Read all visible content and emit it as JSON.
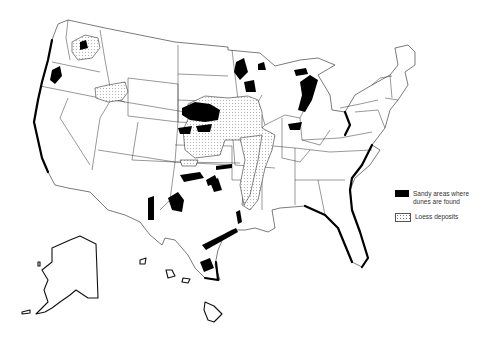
{
  "map": {
    "title": "Sandy areas and loess deposits of the United States",
    "regions_shown": [
      "Contiguous United States",
      "Alaska",
      "Hawaii"
    ]
  },
  "legend": {
    "items": [
      {
        "id": "sandy",
        "label": "Sandy areas where dunes are found",
        "symbol": "solid-black-fill",
        "color": "#000000"
      },
      {
        "id": "loess",
        "label": "Loess deposits",
        "symbol": "stippled-dots",
        "color": "#ffffff"
      }
    ]
  },
  "colors": {
    "background": "#ffffff",
    "boundary": "#222222",
    "sandy": "#000000",
    "loess_stipple": "#777777"
  }
}
